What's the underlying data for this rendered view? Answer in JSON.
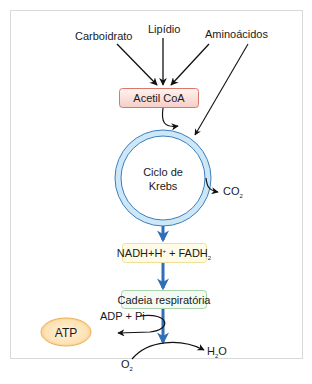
{
  "diagram": {
    "inputs": {
      "carbohydrate": "Carboidrato",
      "lipid": "Lipídio",
      "amino_acids": "Aminoácidos"
    },
    "acetyl_coa": "Acetil CoA",
    "krebs_cycle": {
      "line1": "Ciclo de",
      "line2": "Krebs"
    },
    "co2": {
      "base": "CO",
      "sub": "2"
    },
    "nadh": {
      "part1": "NADH+H",
      "sup": "+",
      "part2": " + FADH",
      "sub": "2"
    },
    "respiratory_chain": "Cadeia respiratória",
    "adp_pi": "ADP + Pi",
    "atp": "ATP",
    "o2": {
      "base": "O",
      "sub": "2"
    },
    "h2o": {
      "base": "H",
      "sub": "2",
      "rest": "O"
    },
    "colors": {
      "acetyl_box_fill": "#fbe3e0",
      "acetyl_box_stroke": "#d9776b",
      "krebs_ring_fill": "#cde7f7",
      "krebs_ring_stroke": "#3a7fbf",
      "flow_arrow": "#2f6fb7",
      "nadh_box_fill": "#fffbe6",
      "nadh_box_stroke": "#f0df9a",
      "chain_box_fill": "#f3faf3",
      "chain_box_stroke": "#a9d3ab",
      "atp_fill": "#fbd9a0",
      "atp_stroke": "#eab25c",
      "frame": "#d9d9d9"
    }
  }
}
